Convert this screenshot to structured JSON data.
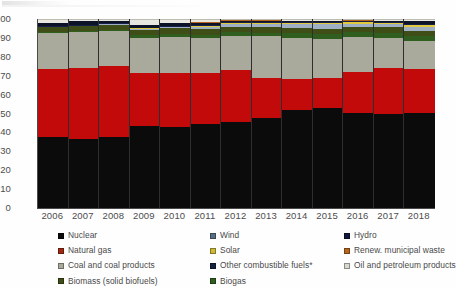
{
  "chart_data": {
    "type": "area",
    "title": "",
    "subtitle": "",
    "xlabel": "",
    "ylabel": "",
    "ylim": [
      0,
      100
    ],
    "yticks": [
      0,
      10,
      20,
      30,
      40,
      50,
      60,
      70,
      80,
      90,
      100
    ],
    "grid": false,
    "legend_position": "bottom",
    "stacked": true,
    "stack_order_bottom_to_top": [
      "Nuclear",
      "Natural gas",
      "Coal and coal products",
      "Biogas",
      "Biomass (solid biofuels)",
      "Wind",
      "Solar",
      "Hydro",
      "Other combustible fuels*",
      "Renew. municipal waste",
      "Oil and petroleum products"
    ],
    "categories": [
      "2006",
      "2007",
      "2008",
      "2009",
      "2010",
      "2011",
      "2012",
      "2013",
      "2014",
      "2015",
      "2016",
      "2017",
      "2018"
    ],
    "series": [
      {
        "name": "Nuclear",
        "color": "#0b0b0b",
        "values": [
          37.5,
          36.5,
          37.5,
          43.5,
          43.0,
          44.5,
          46.0,
          48.5,
          52.5,
          53.5,
          51.0,
          50.5,
          51.0
        ]
      },
      {
        "name": "Natural gas",
        "color": "#c20a0a",
        "values": [
          36.5,
          38.0,
          38.0,
          28.5,
          29.0,
          27.5,
          28.0,
          21.5,
          16.5,
          16.0,
          21.5,
          24.5,
          23.5
        ]
      },
      {
        "name": "Coal and coal products",
        "color": "#a9a99c",
        "values": [
          19.0,
          19.0,
          18.5,
          18.5,
          19.0,
          18.5,
          18.0,
          22.0,
          22.0,
          21.0,
          19.0,
          16.0,
          14.5
        ]
      },
      {
        "name": "Biogas",
        "color": "#2f5e1e",
        "values": [
          0.6,
          0.7,
          0.8,
          1.3,
          1.5,
          1.7,
          1.9,
          2.1,
          2.3,
          2.4,
          2.5,
          2.6,
          2.7
        ]
      },
      {
        "name": "Biomass (solid biofuels)",
        "color": "#3f4d16",
        "values": [
          2.4,
          2.5,
          2.5,
          3.0,
          3.0,
          3.1,
          3.0,
          2.9,
          2.9,
          2.9,
          2.9,
          3.0,
          3.1
        ]
      },
      {
        "name": "Wind",
        "color": "#9fb0c4",
        "values": [
          0.2,
          0.3,
          0.4,
          0.6,
          0.8,
          1.1,
          1.5,
          1.9,
          2.2,
          2.4,
          1.5,
          1.6,
          1.9
        ]
      },
      {
        "name": "Solar",
        "color": "#e0c93c",
        "values": [
          0.0,
          0.0,
          0.0,
          0.1,
          0.2,
          0.4,
          0.5,
          0.6,
          0.7,
          0.8,
          0.9,
          0.9,
          1.0
        ]
      },
      {
        "name": "Hydro",
        "color": "#151f4a",
        "values": [
          0.5,
          0.5,
          0.5,
          0.5,
          0.5,
          0.5,
          0.5,
          0.5,
          0.5,
          0.5,
          0.5,
          0.5,
          0.5
        ]
      },
      {
        "name": "Other combustible fuels*",
        "color": "#0d1326",
        "values": [
          1.6,
          1.7,
          1.1,
          1.2,
          1.2,
          1.1,
          0.6,
          0.4,
          0.3,
          0.4,
          0.2,
          0.3,
          1.6
        ]
      },
      {
        "name": "Renew. municipal waste",
        "color": "#b5651d",
        "values": [
          0.2,
          0.2,
          0.2,
          0.3,
          0.3,
          0.3,
          0.3,
          0.3,
          0.3,
          0.3,
          0.3,
          0.3,
          0.3
        ]
      },
      {
        "name": "Oil and petroleum products",
        "color": "#e8e8e0",
        "values": [
          1.5,
          0.6,
          0.5,
          2.5,
          1.5,
          1.3,
          0.2,
          0.2,
          0.3,
          0.3,
          0.2,
          0.3,
          0.4
        ]
      }
    ]
  },
  "legend": {
    "items": [
      {
        "label": "Nuclear",
        "color": "#0b0b0b"
      },
      {
        "label": "Natural gas",
        "color": "#9c2a12"
      },
      {
        "label": "Coal and coal products",
        "color": "#a9a99c"
      },
      {
        "label": "Biomass (solid biofuels)",
        "color": "#3f4d16"
      },
      {
        "label": "Wind",
        "color": "#5a6e82"
      },
      {
        "label": "Solar",
        "color": "#ccb938"
      },
      {
        "label": "Other combustible fuels*",
        "color": "#16203f"
      },
      {
        "label": "Biogas",
        "color": "#2f5e1e"
      },
      {
        "label": "Hydro",
        "color": "#11183a"
      },
      {
        "label": "Renew. municipal waste",
        "color": "#b5651d"
      },
      {
        "label": "Oil and petroleum products",
        "color": "#d8d8cf"
      }
    ]
  }
}
